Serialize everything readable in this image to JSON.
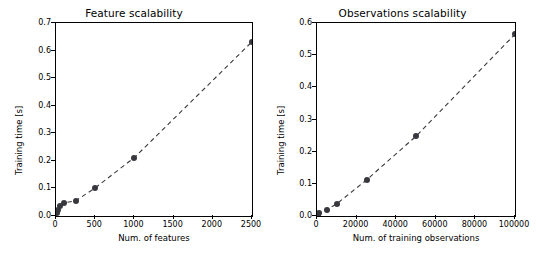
{
  "chart_data": [
    {
      "type": "scatter",
      "title": "Feature scalability",
      "xlabel": "Num. of features",
      "ylabel": "Training time [s]",
      "xlim": [
        0,
        2500
      ],
      "ylim": [
        0.0,
        0.7
      ],
      "xticks": [
        "0",
        "500",
        "1000",
        "1500",
        "2000",
        "2500"
      ],
      "xtick_values": [
        0,
        500,
        1000,
        1500,
        2000,
        2500
      ],
      "yticks": [
        "0.0",
        "0.1",
        "0.2",
        "0.3",
        "0.4",
        "0.5",
        "0.6",
        "0.7"
      ],
      "ytick_values": [
        0.0,
        0.1,
        0.2,
        0.3,
        0.4,
        0.5,
        0.6,
        0.7
      ],
      "grid": false,
      "legend": null,
      "x": [
        10,
        25,
        50,
        100,
        250,
        500,
        1000,
        2500
      ],
      "y": [
        0.012,
        0.02,
        0.035,
        0.048,
        0.055,
        0.102,
        0.212,
        0.632
      ],
      "series": [
        {
          "name": "Training time",
          "style": "dashed-line-with-markers",
          "color": "#38383f",
          "values": [
            0.012,
            0.02,
            0.035,
            0.048,
            0.055,
            0.102,
            0.212,
            0.632
          ]
        }
      ]
    },
    {
      "type": "scatter",
      "title": "Observations scalability",
      "xlabel": "Num. of training observations",
      "ylabel": "Training time [s]",
      "xlim": [
        0,
        100000
      ],
      "ylim": [
        0.0,
        0.6
      ],
      "xticks": [
        "0",
        "20000",
        "40000",
        "60000",
        "80000",
        "100000"
      ],
      "xtick_values": [
        0,
        20000,
        40000,
        60000,
        80000,
        100000
      ],
      "yticks": [
        "0.0",
        "0.1",
        "0.2",
        "0.3",
        "0.4",
        "0.5",
        "0.6"
      ],
      "ytick_values": [
        0.0,
        0.1,
        0.2,
        0.3,
        0.4,
        0.5,
        0.6
      ],
      "grid": false,
      "legend": null,
      "x": [
        500,
        1000,
        5000,
        10000,
        25000,
        50000,
        100000
      ],
      "y": [
        0.004,
        0.008,
        0.02,
        0.038,
        0.112,
        0.248,
        0.565
      ],
      "series": [
        {
          "name": "Training time",
          "style": "dashed-line-with-markers",
          "color": "#38383f",
          "values": [
            0.004,
            0.008,
            0.02,
            0.038,
            0.112,
            0.248,
            0.565
          ]
        }
      ]
    }
  ]
}
